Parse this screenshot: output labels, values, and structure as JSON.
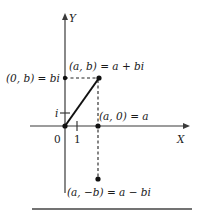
{
  "diagram": {
    "type": "complex-plane",
    "axes": {
      "x_label": "X",
      "y_label": "Y",
      "origin_label": "0",
      "x_tick_label": "1",
      "y_tick_label": "i"
    },
    "points": [
      {
        "id": "a_plus_bi",
        "label": "(a, b) = a + bi"
      },
      {
        "id": "zero_b",
        "label": "(0, b) = bi"
      },
      {
        "id": "a_zero",
        "label": "(a, 0) = a"
      },
      {
        "id": "a_minus_bi",
        "label": "(a, −b) = a − bi"
      }
    ]
  }
}
